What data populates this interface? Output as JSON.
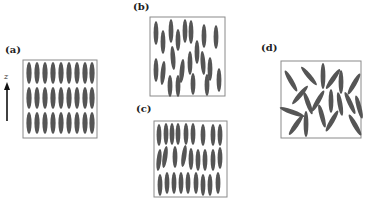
{
  "panels": {
    "a": {
      "label": "(a)",
      "phase": "smectic-like aligned layers",
      "rows": 3,
      "cols": 9
    },
    "b": {
      "label": "(b)",
      "phase": "nematic (orientational order, positional disorder)"
    },
    "c": {
      "label": "(c)",
      "phase": "layered with fluctuations",
      "rows": 3
    },
    "d": {
      "label": "(d)",
      "phase": "isotropic (random orientations)"
    }
  },
  "axis": {
    "label": "z",
    "direction": "up"
  },
  "colors": {
    "rod": "#555555",
    "border": "#8a8a8a",
    "text": "#222222"
  }
}
